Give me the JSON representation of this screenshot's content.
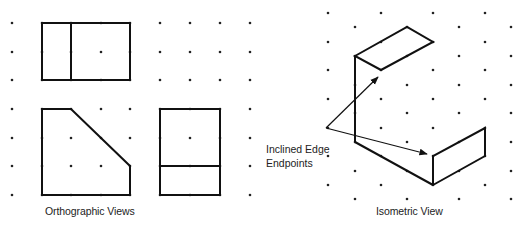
{
  "captions": {
    "orthographic": "Orthographic Views",
    "isometric": "Isometric View",
    "annotation_line1": "Inclined Edge",
    "annotation_line2": "Endpoints"
  },
  "colors": {
    "line": "#111111",
    "dot": "#222222",
    "background": "#ffffff"
  },
  "ortho_grid": {
    "cols": [
      12,
      42,
      71,
      101,
      130,
      160,
      190,
      220,
      250
    ],
    "rows": [
      23,
      52,
      80,
      109,
      138,
      166,
      195
    ]
  },
  "iso_grid": {
    "even_cols": [
      328,
      381,
      433,
      485
    ],
    "even_rows": [
      13,
      42,
      70,
      99,
      128,
      156,
      185
    ],
    "odd_cols": [
      355,
      407,
      459,
      511
    ],
    "odd_rows": [
      27,
      56,
      85,
      113,
      142,
      171,
      199
    ]
  },
  "ortho_shapes": [
    {
      "name": "top-view-outer",
      "points": "42,23 130,23 130,80 42,80"
    },
    {
      "name": "top-view-divider",
      "points": "71,23 71,80"
    },
    {
      "name": "front-view",
      "points": "42,109 71,109 130,166 130,195 42,195"
    },
    {
      "name": "side-view-outer",
      "points": "160,109 220,109 220,195 160,195"
    },
    {
      "name": "side-view-divider",
      "points": "160,166 220,166"
    }
  ],
  "iso_shapes": [
    {
      "name": "iso-top-face",
      "points": "355,56 407,27 433,42 381,70"
    },
    {
      "name": "iso-vertical-edge",
      "points": "355,56 355,142"
    },
    {
      "name": "iso-inclined-edge",
      "points": "355,142 433,185"
    },
    {
      "name": "iso-right-face",
      "points": "433,185 485,156 485,128 433,156 433,185"
    }
  ],
  "arrows": {
    "origin": [
      326,
      128
    ],
    "targets": [
      [
        378,
        77
      ],
      [
        427,
        154
      ]
    ]
  }
}
